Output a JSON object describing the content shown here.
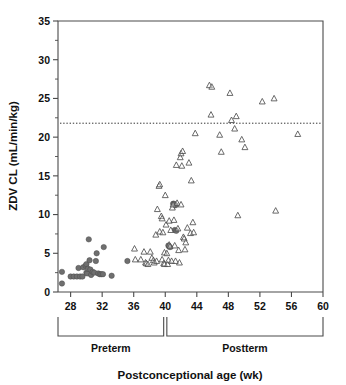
{
  "chart_data": {
    "type": "scatter",
    "title": "",
    "xlabel": "Postconceptional age (wk)",
    "ylabel": "ZDV CL (mL/min/kg)",
    "xlim": [
      26.4,
      60
    ],
    "ylim": [
      0,
      35
    ],
    "xticks": [
      28,
      32,
      36,
      40,
      44,
      48,
      52,
      56,
      60
    ],
    "xticklabels": [
      "28",
      "32",
      "36",
      "40",
      "44",
      "48",
      "52",
      "56",
      "60"
    ],
    "yticks": [
      0,
      5,
      10,
      15,
      20,
      25,
      30,
      35
    ],
    "yticklabels": [
      "0",
      "5",
      "10",
      "15",
      "20",
      "25",
      "30",
      "35"
    ],
    "grid": false,
    "legend": null,
    "annotations": [
      {
        "name": "reference-line",
        "kind": "hline",
        "y": 21.8,
        "style": "dotted",
        "label": ""
      },
      {
        "name": "group-bracket-preterm",
        "kind": "bracket",
        "x_from": 26.4,
        "x_to": 39.8,
        "label": "Preterm"
      },
      {
        "name": "group-bracket-postterm",
        "kind": "bracket",
        "x_from": 40.2,
        "x_to": 60.0,
        "label": "Postterm"
      }
    ],
    "series": [
      {
        "name": "Preterm",
        "marker": "filled-circle",
        "color": "#6f6f6f",
        "points": [
          [
            26.9,
            1.1
          ],
          [
            26.9,
            2.6
          ],
          [
            28.0,
            2.0
          ],
          [
            28.4,
            2.0
          ],
          [
            28.8,
            2.0
          ],
          [
            29.0,
            3.1
          ],
          [
            29.2,
            2.0
          ],
          [
            29.5,
            2.0
          ],
          [
            29.6,
            3.2
          ],
          [
            29.9,
            3.4
          ],
          [
            30.0,
            3.6
          ],
          [
            30.0,
            2.5
          ],
          [
            30.1,
            2.4
          ],
          [
            30.2,
            3.0
          ],
          [
            30.3,
            6.8
          ],
          [
            30.4,
            4.1
          ],
          [
            30.5,
            2.9
          ],
          [
            30.6,
            2.2
          ],
          [
            30.8,
            2.6
          ],
          [
            31.0,
            2.5
          ],
          [
            31.2,
            4.0
          ],
          [
            31.3,
            5.0
          ],
          [
            31.5,
            2.4
          ],
          [
            31.7,
            2.3
          ],
          [
            31.9,
            2.3
          ],
          [
            32.1,
            2.3
          ],
          [
            32.2,
            5.8
          ],
          [
            33.2,
            2.1
          ],
          [
            35.2,
            4.0
          ],
          [
            40.4,
            6.0
          ],
          [
            40.6,
            5.8
          ],
          [
            41.0,
            11.4
          ],
          [
            41.1,
            11.4
          ],
          [
            41.3,
            11.2
          ],
          [
            41.2,
            8.0
          ],
          [
            41.4,
            7.9
          ]
        ]
      },
      {
        "name": "Postterm",
        "marker": "open-triangle",
        "color": "#4f4f4f",
        "points": [
          [
            36.1,
            5.6
          ],
          [
            36.2,
            4.2
          ],
          [
            36.9,
            4.2
          ],
          [
            37.3,
            5.2
          ],
          [
            37.5,
            3.8
          ],
          [
            37.6,
            3.7
          ],
          [
            37.8,
            3.6
          ],
          [
            38.1,
            5.2
          ],
          [
            38.3,
            4.4
          ],
          [
            38.5,
            4.1
          ],
          [
            38.6,
            3.8
          ],
          [
            38.8,
            7.4
          ],
          [
            38.9,
            4.0
          ],
          [
            39.0,
            10.7
          ],
          [
            39.2,
            13.7
          ],
          [
            39.3,
            13.9
          ],
          [
            39.3,
            7.8
          ],
          [
            39.5,
            9.8
          ],
          [
            39.6,
            9.5
          ],
          [
            39.6,
            4.2
          ],
          [
            39.7,
            7.7
          ],
          [
            39.8,
            3.7
          ],
          [
            39.9,
            5.1
          ],
          [
            39.9,
            3.6
          ],
          [
            40.0,
            12.5
          ],
          [
            40.1,
            8.7
          ],
          [
            40.2,
            5.0
          ],
          [
            40.3,
            3.6
          ],
          [
            40.4,
            4.1
          ],
          [
            40.5,
            9.2
          ],
          [
            40.5,
            6.1
          ],
          [
            40.6,
            5.9
          ],
          [
            40.7,
            8.0
          ],
          [
            40.8,
            4.0
          ],
          [
            40.9,
            10.9
          ],
          [
            41.0,
            11.3
          ],
          [
            41.1,
            9.3
          ],
          [
            41.2,
            6.0
          ],
          [
            41.3,
            4.0
          ],
          [
            41.4,
            16.4
          ],
          [
            41.5,
            11.5
          ],
          [
            41.6,
            8.2
          ],
          [
            41.7,
            5.4
          ],
          [
            41.8,
            3.8
          ],
          [
            41.9,
            17.4
          ],
          [
            42.0,
            17.9
          ],
          [
            42.0,
            11.3
          ],
          [
            42.1,
            16.3
          ],
          [
            42.2,
            18.2
          ],
          [
            42.3,
            7.1
          ],
          [
            42.4,
            6.9
          ],
          [
            42.5,
            5.5
          ],
          [
            42.6,
            6.4
          ],
          [
            42.8,
            8.3
          ],
          [
            43.0,
            16.7
          ],
          [
            43.2,
            7.6
          ],
          [
            43.3,
            14.4
          ],
          [
            43.5,
            9.0
          ],
          [
            43.6,
            7.7
          ],
          [
            43.8,
            20.5
          ],
          [
            45.6,
            26.7
          ],
          [
            45.9,
            26.5
          ],
          [
            45.8,
            22.9
          ],
          [
            46.9,
            20.3
          ],
          [
            47.1,
            18.1
          ],
          [
            48.2,
            25.7
          ],
          [
            48.4,
            22.2
          ],
          [
            48.8,
            21.1
          ],
          [
            49.0,
            22.7
          ],
          [
            49.2,
            9.9
          ],
          [
            49.7,
            19.7
          ],
          [
            50.1,
            18.7
          ],
          [
            52.3,
            24.6
          ],
          [
            53.8,
            25.0
          ],
          [
            54.0,
            10.5
          ],
          [
            56.8,
            20.4
          ]
        ]
      }
    ]
  }
}
